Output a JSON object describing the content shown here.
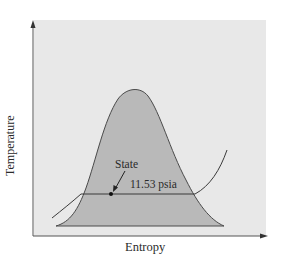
{
  "diagram": {
    "type": "T-s diagram",
    "x_axis_label": "Entropy",
    "y_axis_label": "Temperature",
    "annotations": {
      "state_label": "State",
      "pressure_label": "11.53 psia"
    },
    "elements": [
      "saturation dome (shaded)",
      "isobar line at 11.53 psia",
      "state point on isobar inside dome"
    ],
    "colors": {
      "panel_background": "#e8e8e8",
      "dome_fill": "#b9b9b9",
      "line": "#3a3a3a",
      "axis": "#555555"
    }
  }
}
